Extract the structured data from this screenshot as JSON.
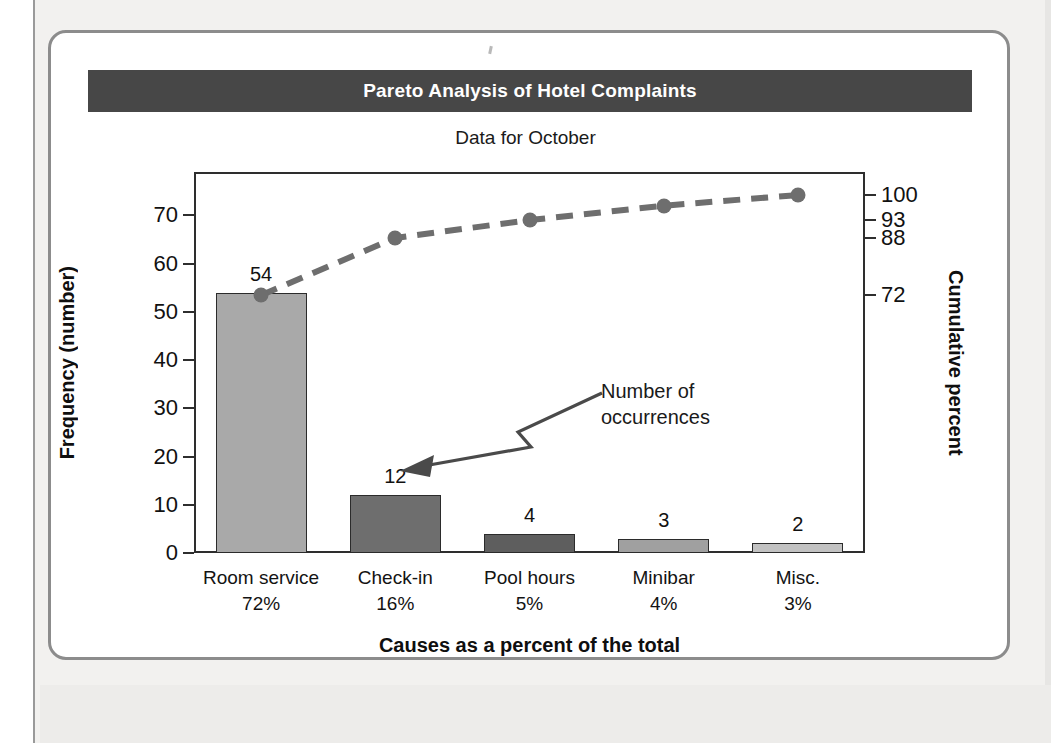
{
  "figure": {
    "title": "Pareto Analysis of Hotel Complaints",
    "subtitle": "Data for October",
    "title_bar_color": "#474747",
    "title_text_color": "#ffffff"
  },
  "annotation": {
    "line1": "Number of",
    "line2": "occurrences"
  },
  "axes": {
    "y_left_label": "Frequency (number)",
    "y_right_label": "Cumulative percent",
    "x_label": "Causes as a percent of the total"
  },
  "chart_data": {
    "type": "bar",
    "title": "Pareto Analysis of Hotel Complaints",
    "subtitle": "Data for October",
    "xlabel": "Causes as a percent of the total",
    "ylabel": "Frequency (number)",
    "y2label": "Cumulative percent",
    "grid": false,
    "legend": "none",
    "categories": [
      "Room service",
      "Check-in",
      "Pool hours",
      "Minibar",
      "Misc."
    ],
    "category_percents": [
      "72%",
      "16%",
      "5%",
      "4%",
      "3%"
    ],
    "values": [
      54,
      12,
      4,
      3,
      2
    ],
    "bar_labels": [
      "54",
      "12",
      "4",
      "3",
      "2"
    ],
    "bar_colors": [
      "#a9a9a9",
      "#6e6e6e",
      "#5e5e5e",
      "#a0a0a0",
      "#c2c2c2"
    ],
    "ylim": [
      0,
      79
    ],
    "yticks": [
      0,
      10,
      20,
      30,
      40,
      50,
      60,
      70
    ],
    "ytick_labels": [
      "0",
      "10",
      "20",
      "30",
      "40",
      "50",
      "60",
      "70"
    ],
    "y2lim": [
      0,
      100
    ],
    "y2ticks": [
      72,
      88,
      93,
      100
    ],
    "y2tick_labels": [
      "72",
      "88",
      "93",
      "100"
    ],
    "series": [
      {
        "name": "Cumulative percent",
        "type": "line",
        "style": "dashed",
        "color": "#6e6e6e",
        "marker": "circle",
        "values": [
          72,
          88,
          93,
          97,
          100
        ]
      }
    ]
  }
}
